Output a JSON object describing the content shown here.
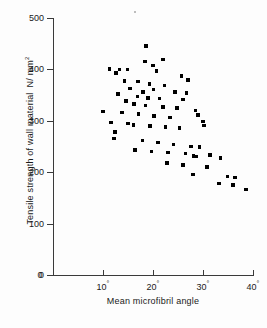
{
  "chart_data": {
    "type": "scatter",
    "title": "",
    "xlabel": "Mean microfibril angle",
    "ylabel": "Tensile strength of wall material",
    "yunit": "N/mm²",
    "xlim": [
      0,
      40
    ],
    "ylim": [
      0,
      500
    ],
    "xticks": [
      0,
      10,
      20,
      30,
      40
    ],
    "xtick_labels": [
      "0",
      "10°",
      "20°",
      "30°",
      "40°"
    ],
    "xtick_values": [
      "0",
      "10",
      "20",
      "30",
      "40"
    ],
    "yticks": [
      0,
      100,
      200,
      300,
      400,
      500
    ],
    "ytick_labels": [
      "0",
      "100",
      "200",
      "300",
      "400",
      "500"
    ],
    "grid": false,
    "legend": false,
    "marker": "square",
    "marker_color": "#000000",
    "points": [
      [
        18.6,
        446
      ],
      [
        22.0,
        419
      ],
      [
        18.4,
        415
      ],
      [
        20.0,
        408
      ],
      [
        13.3,
        400
      ],
      [
        11.3,
        401
      ],
      [
        14.9,
        400
      ],
      [
        20.7,
        397
      ],
      [
        12.6,
        393
      ],
      [
        14.3,
        377
      ],
      [
        25.7,
        387
      ],
      [
        27.0,
        379
      ],
      [
        17.0,
        376
      ],
      [
        19.3,
        372
      ],
      [
        22.3,
        369
      ],
      [
        15.4,
        363
      ],
      [
        20.1,
        361
      ],
      [
        18.0,
        356
      ],
      [
        24.4,
        356
      ],
      [
        26.7,
        354
      ],
      [
        13.0,
        352
      ],
      [
        16.9,
        347
      ],
      [
        19.0,
        344
      ],
      [
        21.3,
        343
      ],
      [
        26.0,
        341
      ],
      [
        14.6,
        339
      ],
      [
        16.2,
        333
      ],
      [
        18.5,
        330
      ],
      [
        22.0,
        327
      ],
      [
        24.8,
        325
      ],
      [
        10.0,
        318
      ],
      [
        13.8,
        316
      ],
      [
        17.1,
        313
      ],
      [
        20.2,
        309
      ],
      [
        23.4,
        306
      ],
      [
        28.5,
        320
      ],
      [
        29.0,
        311
      ],
      [
        11.6,
        297
      ],
      [
        15.0,
        295
      ],
      [
        16.1,
        292
      ],
      [
        19.4,
        290
      ],
      [
        22.5,
        288
      ],
      [
        25.3,
        286
      ],
      [
        30.0,
        299
      ],
      [
        30.2,
        291
      ],
      [
        12.4,
        278
      ],
      [
        12.2,
        266
      ],
      [
        17.9,
        262
      ],
      [
        21.0,
        258
      ],
      [
        24.1,
        254
      ],
      [
        27.6,
        250
      ],
      [
        29.3,
        249
      ],
      [
        16.4,
        243
      ],
      [
        19.7,
        240
      ],
      [
        23.0,
        238
      ],
      [
        26.5,
        236
      ],
      [
        28.1,
        232
      ],
      [
        28.6,
        231
      ],
      [
        31.4,
        233
      ],
      [
        22.8,
        218
      ],
      [
        26.0,
        214
      ],
      [
        30.8,
        210
      ],
      [
        33.5,
        228
      ],
      [
        28.0,
        196
      ],
      [
        34.9,
        192
      ],
      [
        36.4,
        190
      ],
      [
        33.2,
        178
      ],
      [
        36.0,
        175
      ],
      [
        38.6,
        166
      ]
    ]
  },
  "axis": {
    "y_title_main": "Tensile strength of wall material",
    "y_unit_main": "N/ mm",
    "y_unit_sup": "2",
    "x_title": "Mean microfibril angle"
  },
  "icons": {
    "scan_speck": "dust-speck"
  }
}
